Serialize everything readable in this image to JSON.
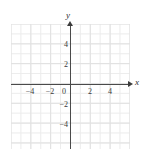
{
  "figure": {
    "kind": "blank-cartesian-coordinate-plane",
    "background_color": "#ffffff",
    "grid_color": "#e4e4e4",
    "axis_color": "#4a4a4a",
    "label_color": "#3a3a3a"
  },
  "axes": {
    "x_name": "x",
    "y_name": "y",
    "origin_label": "0"
  },
  "chart_data": {
    "type": "scatter",
    "title": "",
    "subtitle": "",
    "xlabel": "x",
    "ylabel": "y",
    "grid": true,
    "minor_grid": true,
    "legend": false,
    "legend_position": "none",
    "series": [],
    "annotations": [],
    "xlim": [
      -6,
      6
    ],
    "ylim": [
      -6.5,
      6
    ],
    "xtick_step": 2,
    "ytick_step": 2,
    "minor_tick_step": 1,
    "xticks": [
      -4,
      -2,
      0,
      2,
      4
    ],
    "yticks": [
      4,
      2,
      -2,
      -4
    ],
    "xtick_labels": [
      "-4",
      "-2",
      "0",
      "2",
      "4"
    ],
    "ytick_labels": [
      "4",
      "2",
      "-2",
      "-4"
    ],
    "x": [],
    "values": []
  },
  "x_ticks": [
    {
      "value": -4,
      "label": "−4",
      "pos": 30
    },
    {
      "value": -2,
      "label": "−2",
      "pos": 50
    },
    {
      "value": 2,
      "label": "2",
      "pos": 90
    },
    {
      "value": 4,
      "label": "4",
      "pos": 110
    }
  ],
  "y_ticks": [
    {
      "value": 4,
      "label": "4",
      "pos": 45
    },
    {
      "value": 2,
      "label": "2",
      "pos": 65
    },
    {
      "value": -2,
      "label": "−2",
      "pos": 105
    },
    {
      "value": -4,
      "label": "−4",
      "pos": 125
    }
  ]
}
